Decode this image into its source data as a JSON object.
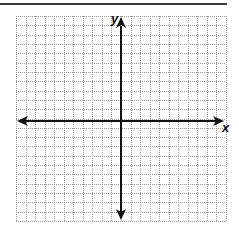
{
  "diagram": {
    "type": "coordinate-plane",
    "x_axis_label": "x",
    "y_axis_label": "y",
    "grid": {
      "columns": 22,
      "rows": 22,
      "left": 16,
      "top": 16,
      "right": 226,
      "bottom": 221,
      "line_color": "#9a9a9a",
      "line_style": "dotted"
    },
    "axes": {
      "origin_x": 121,
      "origin_y": 121,
      "color": "#111111",
      "arrows": [
        "left",
        "right",
        "up",
        "down"
      ]
    }
  }
}
